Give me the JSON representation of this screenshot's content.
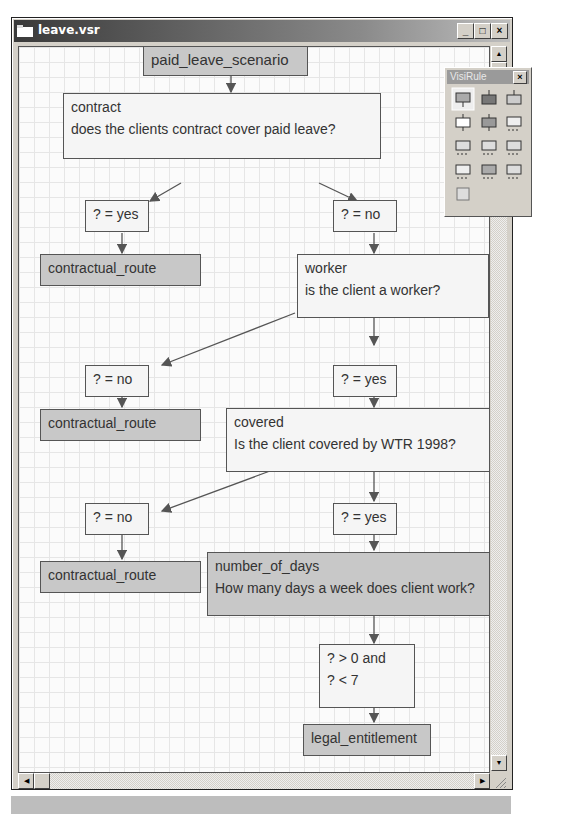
{
  "window": {
    "title": "leave.vsr",
    "controls": {
      "minimize": "_",
      "maximize": "□",
      "close": "×"
    }
  },
  "palette": {
    "title": "VisiRule",
    "close": "×",
    "tools": [
      {
        "name": "statement-box-tool"
      },
      {
        "name": "start-box-tool"
      },
      {
        "name": "end-box-tool"
      },
      {
        "name": "question-box-tool"
      },
      {
        "name": "dark-question-box-tool"
      },
      {
        "name": "multi-choice-tool"
      },
      {
        "name": "menu-single-tool"
      },
      {
        "name": "menu-multi-tool"
      },
      {
        "name": "numeric-input-tool"
      },
      {
        "name": "text-input-tool"
      },
      {
        "name": "dark-input-tool"
      },
      {
        "name": "expression-tool"
      },
      {
        "name": "grid-tool"
      }
    ]
  },
  "diagram": {
    "nodes": {
      "start": {
        "label": "paid_leave_scenario"
      },
      "contract": {
        "name": "contract",
        "question": "does the clients contract cover paid leave?"
      },
      "contract_yes": {
        "label": "? = yes"
      },
      "contract_no": {
        "label": "? = no"
      },
      "route1": {
        "label": "contractual_route"
      },
      "worker": {
        "name": "worker",
        "question": "is the client a worker?"
      },
      "worker_no": {
        "label": "? = no"
      },
      "worker_yes": {
        "label": "? = yes"
      },
      "route2": {
        "label": "contractual_route"
      },
      "covered": {
        "name": "covered",
        "question": "Is the client covered by WTR 1998?"
      },
      "covered_no": {
        "label": "? = no"
      },
      "covered_yes": {
        "label": "? = yes"
      },
      "route3": {
        "label": "contractual_route"
      },
      "days": {
        "name": "number_of_days",
        "question": "How many days a week does client work?"
      },
      "range": {
        "line1": "? > 0 and",
        "line2": "? < 7"
      },
      "legal": {
        "label": "legal_entitlement"
      }
    }
  },
  "colors": {
    "dark_node": "#c8c8c8",
    "light_node": "#f5f5f5",
    "edge": "#555555"
  }
}
